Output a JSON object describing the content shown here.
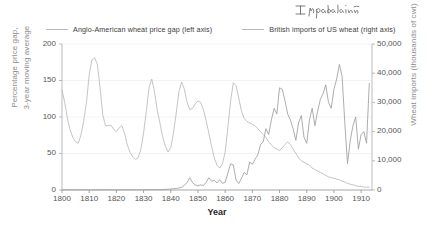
{
  "annotation": {
    "handwritten_note": "Impulation"
  },
  "legend": {
    "position": "top",
    "items": [
      {
        "label": "Anglo-American wheat price gap (left axis)",
        "color": "#b9b9b9",
        "name": "price-gap"
      },
      {
        "label": "British imports of US wheat (right axis)",
        "color": "#9e9e9e",
        "name": "imports"
      }
    ]
  },
  "axes": {
    "x_title": "Year",
    "y_left_line1": "Percentage price gap,",
    "y_left_line2": "3-year moving average",
    "y_right_title": "Wheat imports (thousands of cwt)",
    "y_left_ticks": [
      "0",
      "50",
      "100",
      "150",
      "200"
    ],
    "y_right_ticks": [
      "0",
      "10,000",
      "20,000",
      "30,000",
      "40,000",
      "50,000"
    ],
    "x_ticks": [
      "1800",
      "1810",
      "1820",
      "1830",
      "1840",
      "1850",
      "1860",
      "1870",
      "1880",
      "1890",
      "1900",
      "1910"
    ]
  },
  "chart_data": {
    "type": "line",
    "title": "",
    "subtitle": "",
    "xlabel": "Year",
    "ylabel": "Percentage price gap, 3-year moving average",
    "y2label": "Wheat imports (thousands of cwt)",
    "xlim": [
      1800,
      1914
    ],
    "ylim": [
      0,
      200
    ],
    "y2lim": [
      0,
      50000
    ],
    "grid": true,
    "grid_axis": "y",
    "legend_position": "top",
    "annotations": [
      {
        "text": "Impulation",
        "style": "handwritten",
        "position": "top-right"
      }
    ],
    "series": [
      {
        "name": "Anglo-American wheat price gap (left axis)",
        "axis": "left",
        "color": "#b9b9b9",
        "units": "percent",
        "x": [
          1800,
          1801,
          1802,
          1803,
          1804,
          1805,
          1806,
          1807,
          1808,
          1809,
          1810,
          1811,
          1812,
          1813,
          1814,
          1815,
          1816,
          1817,
          1818,
          1819,
          1820,
          1821,
          1822,
          1823,
          1824,
          1825,
          1826,
          1827,
          1828,
          1829,
          1830,
          1831,
          1832,
          1833,
          1834,
          1835,
          1836,
          1837,
          1838,
          1839,
          1840,
          1841,
          1842,
          1843,
          1844,
          1845,
          1846,
          1847,
          1848,
          1849,
          1850,
          1851,
          1852,
          1853,
          1854,
          1855,
          1856,
          1857,
          1858,
          1859,
          1860,
          1861,
          1862,
          1863,
          1864,
          1865,
          1866,
          1867,
          1868,
          1869,
          1870,
          1871,
          1872,
          1873,
          1874,
          1875,
          1876,
          1877,
          1878,
          1879,
          1880,
          1881,
          1882,
          1883,
          1884,
          1885,
          1886,
          1887,
          1888,
          1889,
          1890,
          1891,
          1892,
          1893,
          1894,
          1895,
          1896,
          1897,
          1898,
          1899,
          1900,
          1901,
          1902,
          1903,
          1904,
          1905,
          1906,
          1907,
          1908,
          1909,
          1910,
          1911,
          1912,
          1913
        ],
        "y": [
          137,
          120,
          98,
          82,
          72,
          66,
          64,
          76,
          95,
          120,
          158,
          178,
          181,
          172,
          140,
          103,
          88,
          88,
          89,
          83,
          80,
          85,
          88,
          78,
          62,
          52,
          45,
          42,
          44,
          56,
          78,
          108,
          140,
          152,
          135,
          110,
          92,
          73,
          60,
          52,
          58,
          78,
          105,
          135,
          148,
          138,
          120,
          110,
          112,
          118,
          122,
          120,
          110,
          95,
          78,
          60,
          44,
          34,
          30,
          36,
          52,
          86,
          122,
          147,
          143,
          126,
          108,
          98,
          94,
          92,
          90,
          88,
          84,
          80,
          76,
          72,
          66,
          62,
          58,
          56,
          54,
          58,
          62,
          66,
          62,
          56,
          50,
          44,
          40,
          38,
          36,
          34,
          30,
          28,
          26,
          24,
          22,
          20,
          18,
          17,
          16,
          15,
          14,
          12,
          11,
          9,
          8,
          7,
          6,
          5,
          5,
          4,
          4,
          4
        ]
      },
      {
        "name": "British imports of US wheat (right axis)",
        "axis": "right",
        "color": "#9e9e9e",
        "units": "thousands of cwt",
        "x": [
          1800,
          1805,
          1810,
          1815,
          1820,
          1825,
          1830,
          1835,
          1838,
          1840,
          1842,
          1844,
          1845,
          1846,
          1847,
          1848,
          1849,
          1850,
          1851,
          1852,
          1853,
          1854,
          1855,
          1856,
          1857,
          1858,
          1859,
          1860,
          1861,
          1862,
          1863,
          1864,
          1865,
          1866,
          1867,
          1868,
          1869,
          1870,
          1871,
          1872,
          1873,
          1874,
          1875,
          1876,
          1877,
          1878,
          1879,
          1880,
          1881,
          1882,
          1883,
          1884,
          1885,
          1886,
          1887,
          1888,
          1889,
          1890,
          1891,
          1892,
          1893,
          1894,
          1895,
          1896,
          1897,
          1898,
          1899,
          1900,
          1901,
          1902,
          1903,
          1904,
          1905,
          1906,
          1907,
          1908,
          1909,
          1910,
          1911,
          1912,
          1913
        ],
        "y": [
          60,
          60,
          60,
          60,
          60,
          60,
          80,
          100,
          200,
          350,
          500,
          900,
          1600,
          2600,
          4200,
          2500,
          1700,
          1400,
          1800,
          1500,
          2600,
          4200,
          3000,
          3300,
          2400,
          3500,
          2300,
          2600,
          5800,
          9000,
          8600,
          3400,
          2200,
          4000,
          6000,
          5200,
          9600,
          8800,
          10500,
          12000,
          15500,
          16500,
          21000,
          19000,
          24000,
          28000,
          26000,
          35000,
          34500,
          30500,
          26000,
          24000,
          21000,
          17000,
          23000,
          25500,
          18000,
          16000,
          24000,
          28000,
          22000,
          27000,
          31000,
          33000,
          36000,
          30000,
          28000,
          34500,
          38000,
          43000,
          39000,
          23000,
          9000,
          17000,
          22000,
          25000,
          14000,
          19000,
          20000,
          16000,
          36500
        ]
      }
    ]
  }
}
